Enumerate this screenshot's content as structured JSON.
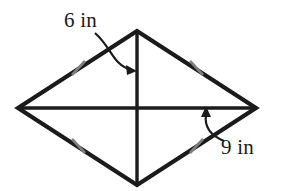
{
  "figure": {
    "name": "rhombus-with-diagonals",
    "background_color": "#ffffff",
    "stroke_color": "#1b1b1b",
    "tick_color": "#808080",
    "annotation_color": "#1b1b1b",
    "canvas": {
      "width": 291,
      "height": 191
    },
    "vertices": {
      "left": {
        "x": 18,
        "y": 108
      },
      "top": {
        "x": 137,
        "y": 31
      },
      "right": {
        "x": 256,
        "y": 108
      },
      "bottom": {
        "x": 137,
        "y": 185
      },
      "center": {
        "x": 137,
        "y": 108
      }
    },
    "edges": [
      {
        "name": "upper-left-edge",
        "from": "left",
        "to": "top"
      },
      {
        "name": "upper-right-edge",
        "from": "top",
        "to": "right"
      },
      {
        "name": "lower-right-edge",
        "from": "right",
        "to": "bottom"
      },
      {
        "name": "lower-left-edge",
        "from": "bottom",
        "to": "left"
      }
    ],
    "diagonals": [
      {
        "name": "vertical-diagonal",
        "from": "top",
        "to": "bottom",
        "measure": "6 in"
      },
      {
        "name": "horizontal-diagonal",
        "from": "left",
        "to": "right",
        "measure": "9 in"
      }
    ],
    "tick_marks": [
      {
        "name": "tick-upper-left",
        "x": 78,
        "y": 68
      },
      {
        "name": "tick-upper-right",
        "x": 196,
        "y": 68
      },
      {
        "name": "tick-lower-left",
        "x": 78,
        "y": 146
      },
      {
        "name": "tick-lower-right",
        "x": 196,
        "y": 146
      }
    ],
    "labels": {
      "vertical_diagonal": "6 in",
      "horizontal_diagonal": "9 in"
    },
    "leader_arrows": [
      {
        "name": "arrow-to-vertical-diagonal",
        "from": {
          "x": 95,
          "y": 33
        },
        "to": {
          "x": 135,
          "y": 70
        }
      },
      {
        "name": "arrow-to-horizontal-diagonal",
        "from": {
          "x": 223,
          "y": 141
        },
        "to": {
          "x": 206,
          "y": 110
        }
      }
    ]
  }
}
